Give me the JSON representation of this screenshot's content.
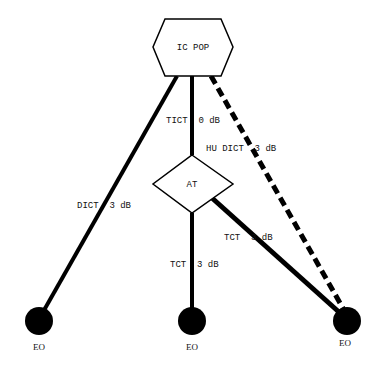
{
  "diagram": {
    "nodes": {
      "ic_pop": {
        "label": "IC POP",
        "shape": "hexagon"
      },
      "at": {
        "label": "AT",
        "shape": "diamond"
      },
      "eo_left": {
        "label": "EO",
        "shape": "filled-circle"
      },
      "eo_middle": {
        "label": "EO",
        "shape": "filled-circle"
      },
      "eo_right": {
        "label": "EO",
        "shape": "filled-circle"
      }
    },
    "edges": {
      "ic_pop_to_eo_left": {
        "label": "DICT  3 dB",
        "style": "solid-thick"
      },
      "ic_pop_to_at": {
        "label": "TICT  0 dB",
        "style": "solid-thick"
      },
      "ic_pop_to_eo_right": {
        "label": "HU DICT  3 dB",
        "style": "dashed-thick"
      },
      "at_to_eo_middle": {
        "label": "TCT  3 dB",
        "style": "solid-thick"
      },
      "at_to_eo_right": {
        "label": "TCT  3 dB",
        "style": "solid-thick"
      }
    },
    "colors": {
      "stroke": "#000000",
      "fill": "#000000",
      "background": "#ffffff"
    }
  }
}
